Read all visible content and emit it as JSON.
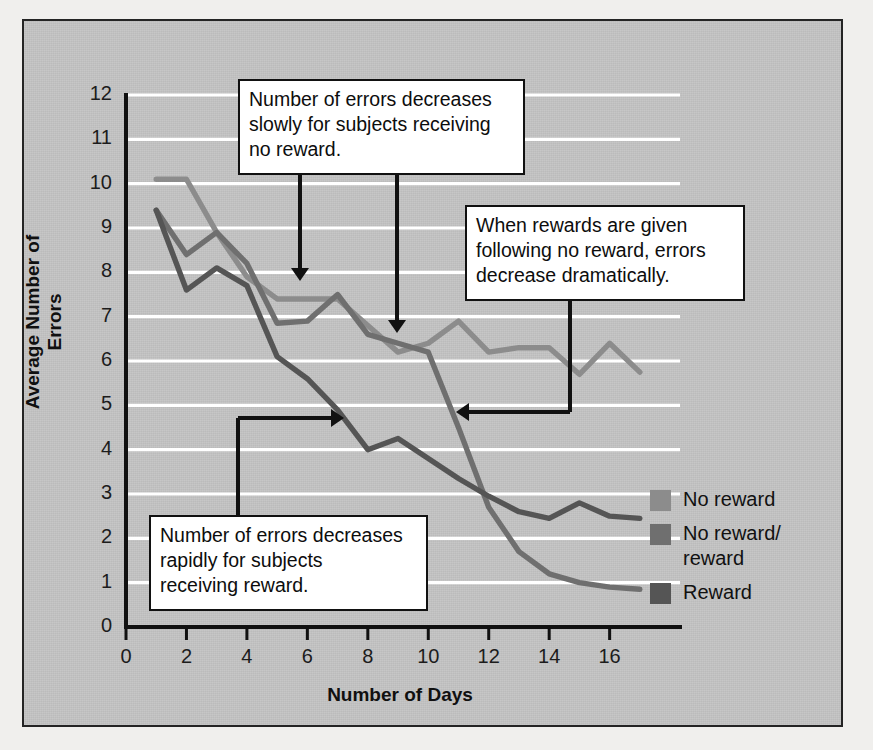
{
  "chart_data": {
    "type": "line",
    "title": "",
    "xlabel": "Number of Days",
    "ylabel": "Average Number of Errors",
    "xlim": [
      0,
      17.6
    ],
    "ylim": [
      0,
      12
    ],
    "xticks": [
      0,
      2,
      4,
      6,
      8,
      10,
      12,
      14,
      16
    ],
    "yticks": [
      0,
      1,
      2,
      3,
      4,
      5,
      6,
      7,
      8,
      9,
      10,
      11,
      12
    ],
    "grid": "horizontal-white",
    "legend_position": "right",
    "x": [
      1,
      2,
      3,
      4,
      5,
      6,
      7,
      8,
      9,
      10,
      11,
      12,
      13,
      14,
      15,
      16,
      17
    ],
    "series": [
      {
        "name": "No reward",
        "color": "#8c8c8c",
        "values": [
          10.1,
          10.1,
          8.9,
          7.9,
          7.4,
          7.4,
          7.4,
          6.8,
          6.2,
          6.4,
          6.9,
          6.2,
          6.3,
          6.3,
          5.7,
          6.4,
          5.75
        ]
      },
      {
        "name": "No reward/reward",
        "color": "#6f6f6f",
        "values": [
          9.4,
          8.4,
          8.9,
          8.2,
          6.85,
          6.9,
          7.5,
          6.6,
          6.4,
          6.2,
          4.5,
          2.7,
          1.7,
          1.2,
          1.0,
          0.9,
          0.85
        ]
      },
      {
        "name": "Reward",
        "color": "#555555",
        "values": [
          9.4,
          7.6,
          8.1,
          7.7,
          6.1,
          5.6,
          4.9,
          4.0,
          4.25,
          3.8,
          3.35,
          2.95,
          2.6,
          2.45,
          2.8,
          2.5,
          2.45
        ]
      }
    ]
  },
  "axis": {
    "y_tick_labels": [
      "12",
      "11",
      "10",
      "9",
      "8",
      "7",
      "6",
      "5",
      "4",
      "3",
      "2",
      "1",
      "0"
    ],
    "x_tick_labels": [
      "0",
      "2",
      "4",
      "6",
      "8",
      "10",
      "12",
      "14",
      "16"
    ],
    "y_title": "Average Number of Errors",
    "x_title": "Number of Days"
  },
  "annotations": [
    {
      "id": "no-reward-note",
      "lines": [
        "Number of errors decreases",
        "slowly for subjects receiving",
        "no reward."
      ]
    },
    {
      "id": "rewards-given-note",
      "lines": [
        "When rewards are given",
        "following no reward, errors",
        "decrease dramatically."
      ]
    },
    {
      "id": "reward-note",
      "lines": [
        "Number of errors decreases",
        "rapidly for subjects",
        "receiving reward."
      ]
    }
  ],
  "legend": {
    "items": [
      {
        "label": "No reward",
        "label2": "",
        "color": "#8c8c8c"
      },
      {
        "label": "No reward/",
        "label2": "reward",
        "color": "#6f6f6f"
      },
      {
        "label": "Reward",
        "label2": "",
        "color": "#555555"
      }
    ]
  },
  "colors": {
    "figure_background": "#c3c3c3",
    "page_background": "#f0efed",
    "frame_border": "#242424",
    "gridline": "#ffffff",
    "axis": "#111111",
    "callout_background": "#ffffff",
    "callout_border": "#111111"
  }
}
